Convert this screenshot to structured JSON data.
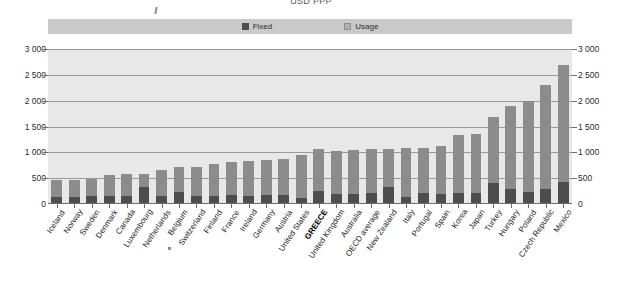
{
  "title": "USD PPP",
  "legend": {
    "entries": [
      {
        "label": "Fixed",
        "color": "#4d4d4d",
        "icon": "square-swatch-icon"
      },
      {
        "label": "Usage",
        "color": "#b0b0b0",
        "icon": "square-swatch-icon"
      }
    ],
    "position": "top-center",
    "band_color": "#c9c9c9"
  },
  "axis": {
    "left_ticks": [
      "3 000",
      "2 500",
      "2 000",
      "1 500",
      "1 000",
      "500",
      "0"
    ],
    "right_ticks": [
      "3 000",
      "2 500",
      "2 000",
      "1 500",
      "1 000",
      "500",
      "0"
    ]
  },
  "chart_data": {
    "type": "bar",
    "subtype": "stacked-column",
    "title": "USD PPP",
    "xlabel": "",
    "ylabel": "",
    "ylim": [
      0,
      3000
    ],
    "ytick_values": [
      0,
      500,
      1000,
      1500,
      2000,
      2500,
      3000
    ],
    "grid": true,
    "legend_position": "top-center",
    "highlight_category": "GREECE",
    "categories": [
      "Iceland",
      "Norway",
      "Sweden",
      "Denmark",
      "Canada",
      "Luxembourg",
      "Netherlands",
      "Belgium",
      "Switzerland",
      "Finland",
      "France",
      "Ireland",
      "Germany",
      "Austria",
      "United States",
      "GREECE",
      "United Kingdom",
      "Australia",
      "OECD average",
      "New Zealand",
      "Italy",
      "Portugal",
      "Spain",
      "Korea",
      "Japan",
      "Turkey",
      "Hungary",
      "Poland",
      "Czech Republic",
      "Mexico"
    ],
    "series": [
      {
        "name": "Fixed",
        "color": "#4d4d4d",
        "values": [
          130,
          140,
          150,
          150,
          150,
          320,
          160,
          230,
          160,
          160,
          170,
          160,
          170,
          180,
          110,
          250,
          200,
          200,
          220,
          330,
          140,
          210,
          190,
          210,
          210,
          400,
          300,
          230,
          300,
          430
        ]
      },
      {
        "name": "Usage",
        "color": "#8c8c8c",
        "values": [
          330,
          320,
          340,
          420,
          430,
          260,
          500,
          490,
          560,
          610,
          640,
          670,
          690,
          690,
          830,
          810,
          830,
          850,
          850,
          740,
          950,
          880,
          930,
          1130,
          1140,
          1280,
          1600,
          1760,
          2000,
          2270
        ]
      }
    ],
    "totals": [
      460,
      460,
      490,
      570,
      580,
      580,
      660,
      720,
      720,
      770,
      810,
      830,
      860,
      870,
      940,
      1060,
      1030,
      1050,
      1070,
      1070,
      1090,
      1090,
      1120,
      1340,
      1350,
      1680,
      1900,
      1990,
      2300,
      2700
    ]
  }
}
